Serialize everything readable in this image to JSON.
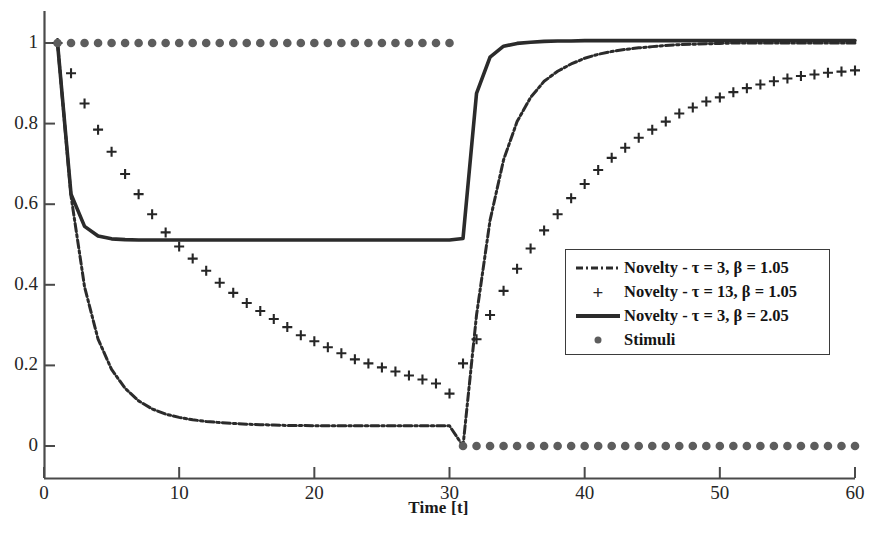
{
  "chart_data": {
    "type": "line",
    "title": "",
    "xlabel": "Time [t]",
    "ylabel": "",
    "xlim": [
      0,
      60
    ],
    "ylim": [
      -0.04,
      1.08
    ],
    "grid": false,
    "xticks": [
      0,
      10,
      20,
      30,
      40,
      50,
      60
    ],
    "xticklabels": [
      "0",
      "10",
      "20",
      "30",
      "40",
      "50",
      "60"
    ],
    "yticks": [
      0,
      0.2,
      0.4,
      0.6,
      0.8,
      1
    ],
    "yticklabels": [
      "0",
      "0.2",
      "0.4",
      "0.6",
      "0.8",
      "1"
    ],
    "legend_position": "center-right",
    "series": [
      {
        "name": "Novelty - τ = 3, β = 1.05",
        "style": "dashdot",
        "color": "#2b2b2b",
        "x": [
          1,
          2,
          3,
          4,
          5,
          6,
          7,
          8,
          9,
          10,
          11,
          12,
          13,
          14,
          15,
          16,
          17,
          18,
          19,
          20,
          21,
          22,
          23,
          24,
          25,
          26,
          27,
          28,
          29,
          30,
          31,
          32,
          33,
          34,
          35,
          36,
          37,
          38,
          39,
          40,
          41,
          42,
          43,
          44,
          45,
          46,
          47,
          48,
          49,
          50,
          51,
          52,
          53,
          54,
          55,
          56,
          57,
          58,
          59,
          60
        ],
        "y": [
          1.0,
          0.62,
          0.395,
          0.265,
          0.19,
          0.143,
          0.112,
          0.092,
          0.079,
          0.071,
          0.065,
          0.061,
          0.058,
          0.056,
          0.054,
          0.053,
          0.052,
          0.051,
          0.051,
          0.05,
          0.05,
          0.05,
          0.05,
          0.05,
          0.05,
          0.05,
          0.05,
          0.05,
          0.05,
          0.05,
          0.0,
          0.325,
          0.56,
          0.71,
          0.805,
          0.865,
          0.905,
          0.93,
          0.948,
          0.962,
          0.972,
          0.979,
          0.984,
          0.988,
          0.991,
          0.994,
          0.996,
          0.997,
          0.998,
          0.999,
          1.0,
          1.0,
          1.0,
          1.0,
          1.0,
          1.0,
          1.0,
          1.0,
          1.0,
          1.0
        ]
      },
      {
        "name": "Novelty - τ = 13, β = 1.05",
        "style": "plus-markers",
        "color": "#262626",
        "x": [
          1,
          2,
          3,
          4,
          5,
          6,
          7,
          8,
          9,
          10,
          11,
          12,
          13,
          14,
          15,
          16,
          17,
          18,
          19,
          20,
          21,
          22,
          23,
          24,
          25,
          26,
          27,
          28,
          29,
          30,
          31,
          32,
          33,
          34,
          35,
          36,
          37,
          38,
          39,
          40,
          41,
          42,
          43,
          44,
          45,
          46,
          47,
          48,
          49,
          50,
          51,
          52,
          53,
          54,
          55,
          56,
          57,
          58,
          59,
          60
        ],
        "y": [
          1.0,
          0.925,
          0.85,
          0.785,
          0.73,
          0.675,
          0.625,
          0.575,
          0.53,
          0.495,
          0.465,
          0.435,
          0.405,
          0.38,
          0.355,
          0.335,
          0.315,
          0.295,
          0.275,
          0.26,
          0.245,
          0.23,
          0.215,
          0.205,
          0.195,
          0.185,
          0.175,
          0.165,
          0.155,
          0.13,
          0.205,
          0.265,
          0.325,
          0.385,
          0.44,
          0.49,
          0.535,
          0.575,
          0.615,
          0.65,
          0.685,
          0.715,
          0.74,
          0.765,
          0.785,
          0.805,
          0.825,
          0.84,
          0.855,
          0.865,
          0.878,
          0.888,
          0.897,
          0.905,
          0.912,
          0.918,
          0.922,
          0.926,
          0.929,
          0.932
        ]
      },
      {
        "name": "Novelty - τ = 3, β = 2.05",
        "style": "solid",
        "color": "#2b2b2b",
        "x": [
          1,
          2,
          3,
          4,
          5,
          6,
          7,
          8,
          9,
          10,
          11,
          12,
          13,
          14,
          15,
          16,
          17,
          18,
          19,
          20,
          21,
          22,
          23,
          24,
          25,
          26,
          27,
          28,
          29,
          30,
          31,
          32,
          33,
          34,
          35,
          36,
          37,
          38,
          39,
          40,
          41,
          42,
          43,
          44,
          45,
          46,
          47,
          48,
          49,
          50,
          51,
          52,
          53,
          54,
          55,
          56,
          57,
          58,
          59,
          60
        ],
        "y": [
          1.0,
          0.625,
          0.545,
          0.521,
          0.514,
          0.512,
          0.511,
          0.511,
          0.511,
          0.511,
          0.511,
          0.511,
          0.511,
          0.511,
          0.511,
          0.511,
          0.511,
          0.511,
          0.511,
          0.511,
          0.511,
          0.511,
          0.511,
          0.511,
          0.511,
          0.511,
          0.511,
          0.511,
          0.511,
          0.511,
          0.515,
          0.875,
          0.965,
          0.992,
          0.999,
          1.002,
          1.004,
          1.005,
          1.005,
          1.006,
          1.006,
          1.006,
          1.006,
          1.006,
          1.006,
          1.006,
          1.006,
          1.006,
          1.006,
          1.006,
          1.006,
          1.006,
          1.006,
          1.006,
          1.006,
          1.006,
          1.006,
          1.006,
          1.006,
          1.006
        ]
      },
      {
        "name": "Stimuli",
        "style": "dot-markers",
        "color": "#5d5d5d",
        "x": [
          1,
          2,
          3,
          4,
          5,
          6,
          7,
          8,
          9,
          10,
          11,
          12,
          13,
          14,
          15,
          16,
          17,
          18,
          19,
          20,
          21,
          22,
          23,
          24,
          25,
          26,
          27,
          28,
          29,
          30,
          31,
          32,
          33,
          34,
          35,
          36,
          37,
          38,
          39,
          40,
          41,
          42,
          43,
          44,
          45,
          46,
          47,
          48,
          49,
          50,
          51,
          52,
          53,
          54,
          55,
          56,
          57,
          58,
          59,
          60
        ],
        "y": [
          1,
          1,
          1,
          1,
          1,
          1,
          1,
          1,
          1,
          1,
          1,
          1,
          1,
          1,
          1,
          1,
          1,
          1,
          1,
          1,
          1,
          1,
          1,
          1,
          1,
          1,
          1,
          1,
          1,
          1,
          0,
          0,
          0,
          0,
          0,
          0,
          0,
          0,
          0,
          0,
          0,
          0,
          0,
          0,
          0,
          0,
          0,
          0,
          0,
          0,
          0,
          0,
          0,
          0,
          0,
          0,
          0,
          0,
          0,
          0
        ]
      }
    ]
  },
  "axis": {
    "x_title": "Time [t]"
  },
  "legend": {
    "entries": [
      {
        "label": "Novelty - τ = 3, β = 1.05",
        "symbol": "dashdot-line-swatch"
      },
      {
        "label": "Novelty - τ = 13, β = 1.05",
        "symbol": "plus-marker-swatch"
      },
      {
        "label": "Novelty - τ = 3, β = 2.05",
        "symbol": "solid-line-swatch"
      },
      {
        "label": "Stimuli",
        "symbol": "dot-marker-swatch"
      }
    ]
  },
  "colors": {
    "line": "#2b2b2b",
    "marker": "#262626",
    "stimuli": "#5d5d5d",
    "axis": "#4a4a4a",
    "background": "#ffffff"
  }
}
